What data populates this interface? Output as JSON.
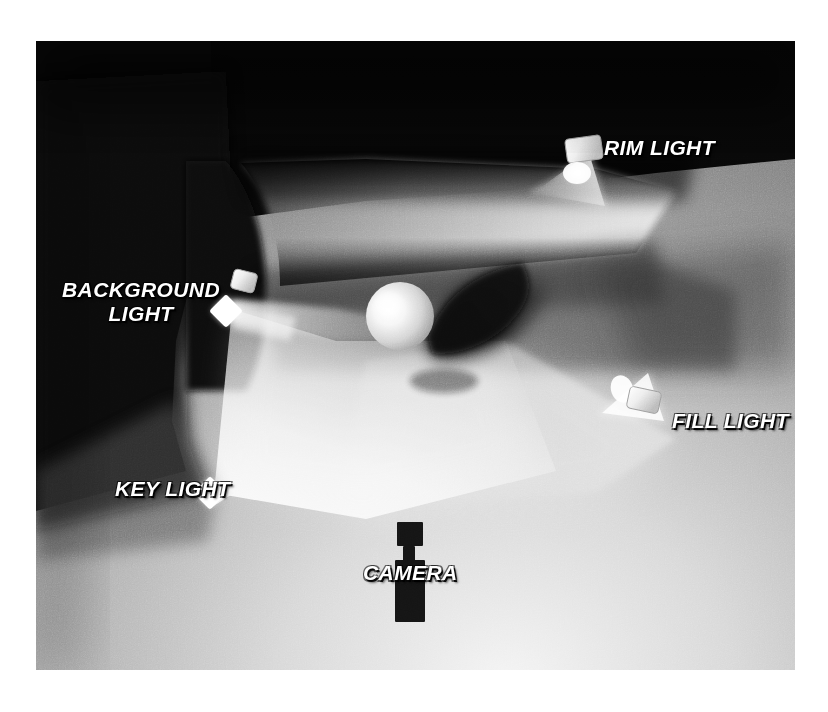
{
  "figure": {
    "kind": "three-point-lighting-diagram",
    "frame": {
      "x": 36,
      "y": 41,
      "width": 759,
      "height": 629
    },
    "background": "#ffffff"
  },
  "labels": {
    "rim_light": "RIM LIGHT",
    "background_light": "BACKGROUND\nLIGHT",
    "background_light_line1": "BACKGROUND",
    "background_light_line2": "LIGHT",
    "key_light": "KEY LIGHT",
    "fill_light": "FILL LIGHT",
    "camera": "CAMERA"
  },
  "colors": {
    "label_text": "#ffffff",
    "label_outline": "#000000",
    "fixture_body": "#f2f2f2",
    "fixture_shadow": "#9a9a9a",
    "camera_silhouette": "#141414",
    "dark_wall": "#0b0b0b",
    "floor_light": "#f0f0f0",
    "floor_mid": "#8f8f8f",
    "floor_dark": "#4a4a4a",
    "sphere_highlight": "#fbfbfb",
    "shadow": "#111111"
  },
  "elements": {
    "lights": [
      {
        "name": "rim-light",
        "label": "RIM LIGHT",
        "fixture_x": 570,
        "fixture_y": 150,
        "beam_direction": "down-left"
      },
      {
        "name": "background-light",
        "label": "BACKGROUND LIGHT",
        "fixture_x": 229,
        "fixture_y": 292,
        "beam_direction": "right"
      },
      {
        "name": "key-light",
        "label": "KEY LIGHT",
        "fixture_x": 209,
        "fixture_y": 492,
        "beam_direction": "up-right"
      },
      {
        "name": "fill-light",
        "label": "FILL LIGHT",
        "fixture_x": 637,
        "fixture_y": 400,
        "beam_direction": "up-left"
      }
    ],
    "subject": {
      "name": "sphere",
      "center_x": 400,
      "center_y": 316,
      "radius": 34
    },
    "camera": {
      "name": "camera",
      "center_x": 409,
      "top_y": 522,
      "bottom_y": 621
    }
  }
}
